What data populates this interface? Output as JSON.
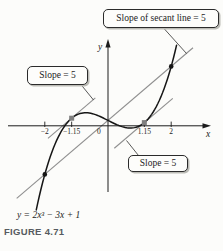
{
  "figure": {
    "caption": "FIGURE 4.71",
    "equation_label": "y = 2x³ − 3x + 1",
    "axis": {
      "x_label": "x",
      "y_label": "y",
      "origin_label": "0",
      "ticks": [
        {
          "value": -2,
          "label": "−2"
        },
        {
          "value": -1.15,
          "label": "−1.15"
        },
        {
          "value": 1.15,
          "label": "1.15"
        },
        {
          "value": 2,
          "label": "2"
        }
      ]
    },
    "callouts": {
      "secant": "Slope of secant line = 5",
      "tangent_left": "Slope = 5",
      "tangent_right": "Slope = 5"
    }
  },
  "colors": {
    "background": "#fcfcfa",
    "curve": "#161616",
    "axis": "#1c1c1c",
    "gray_line": "#8f8f8f",
    "gray_dot": "#7f7f7f",
    "leader": "#2e2e2e",
    "text": "#1c1c1c",
    "caption_text": "#565b60",
    "box_border": "#2b2b2b",
    "box_fill": "#fdfdfb",
    "box_shadow": "#bcbcb6"
  },
  "chart_data": {
    "type": "line",
    "title": "",
    "function": "y = 2x^3 - 3x + 1",
    "coefficients": {
      "cubic": 2,
      "quadratic": 0,
      "linear": -3,
      "constant": 1
    },
    "x_domain_drawn": [
      -2.27,
      2.17
    ],
    "x_ticks": [
      -2,
      -1.15,
      1.15,
      2
    ],
    "axis_labels": {
      "x": "x",
      "y": "y"
    },
    "grid": false,
    "secant_line": {
      "slope": 5,
      "intercept": 1,
      "equation": "y = 5x + 1",
      "through_points": [
        [
          -2,
          -9
        ],
        [
          2,
          11
        ]
      ]
    },
    "tangent_points": [
      {
        "x": -1.15,
        "y": 1.41,
        "slope": 5
      },
      {
        "x": 1.15,
        "y": 0.59,
        "slope": 5
      }
    ],
    "annotations": [
      "Slope of secant line = 5",
      "Slope = 5",
      "Slope = 5"
    ]
  }
}
